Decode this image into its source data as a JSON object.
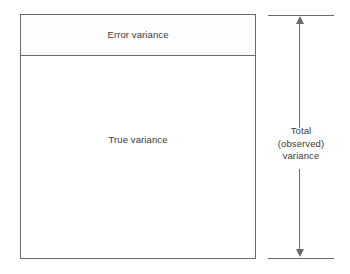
{
  "diagram": {
    "type": "partition-diagram",
    "colors": {
      "line": "#6a6a6a",
      "text": "#3a3a3a",
      "background": "#ffffff",
      "error_band_fill": "#fdfdfd",
      "true_band_fill": "#ffffff"
    },
    "box": {
      "segments": [
        {
          "key": "error",
          "label": "Error variance",
          "proportion_of_total": 0.17
        },
        {
          "key": "true",
          "label": "True variance",
          "proportion_of_total": 0.83
        }
      ]
    },
    "span_indicator": {
      "name": "total-observed-variance",
      "arrow_style": "double-headed-vertical",
      "caption_lines": [
        "Total",
        "(observed)",
        "variance"
      ],
      "spans_segments": [
        "error",
        "true"
      ]
    }
  }
}
